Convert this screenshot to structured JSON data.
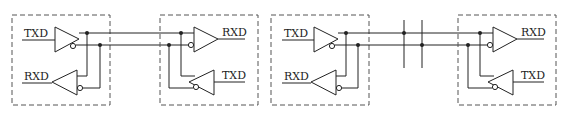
{
  "diagram": {
    "type": "RS-485 / differential bus wiring",
    "colors": {
      "line": "#222222",
      "box": "#555555",
      "background": "#ffffff"
    },
    "left_pair": {
      "node_a": {
        "tx_label": "TXD",
        "rx_label": "RXD"
      },
      "node_b": {
        "tx_label": "TXD",
        "rx_label": "RXD"
      }
    },
    "right_pair": {
      "node_a": {
        "tx_label": "TXD",
        "rx_label": "RXD"
      },
      "node_b": {
        "tx_label": "TXD",
        "rx_label": "RXD"
      },
      "bus_taps": 2
    }
  }
}
